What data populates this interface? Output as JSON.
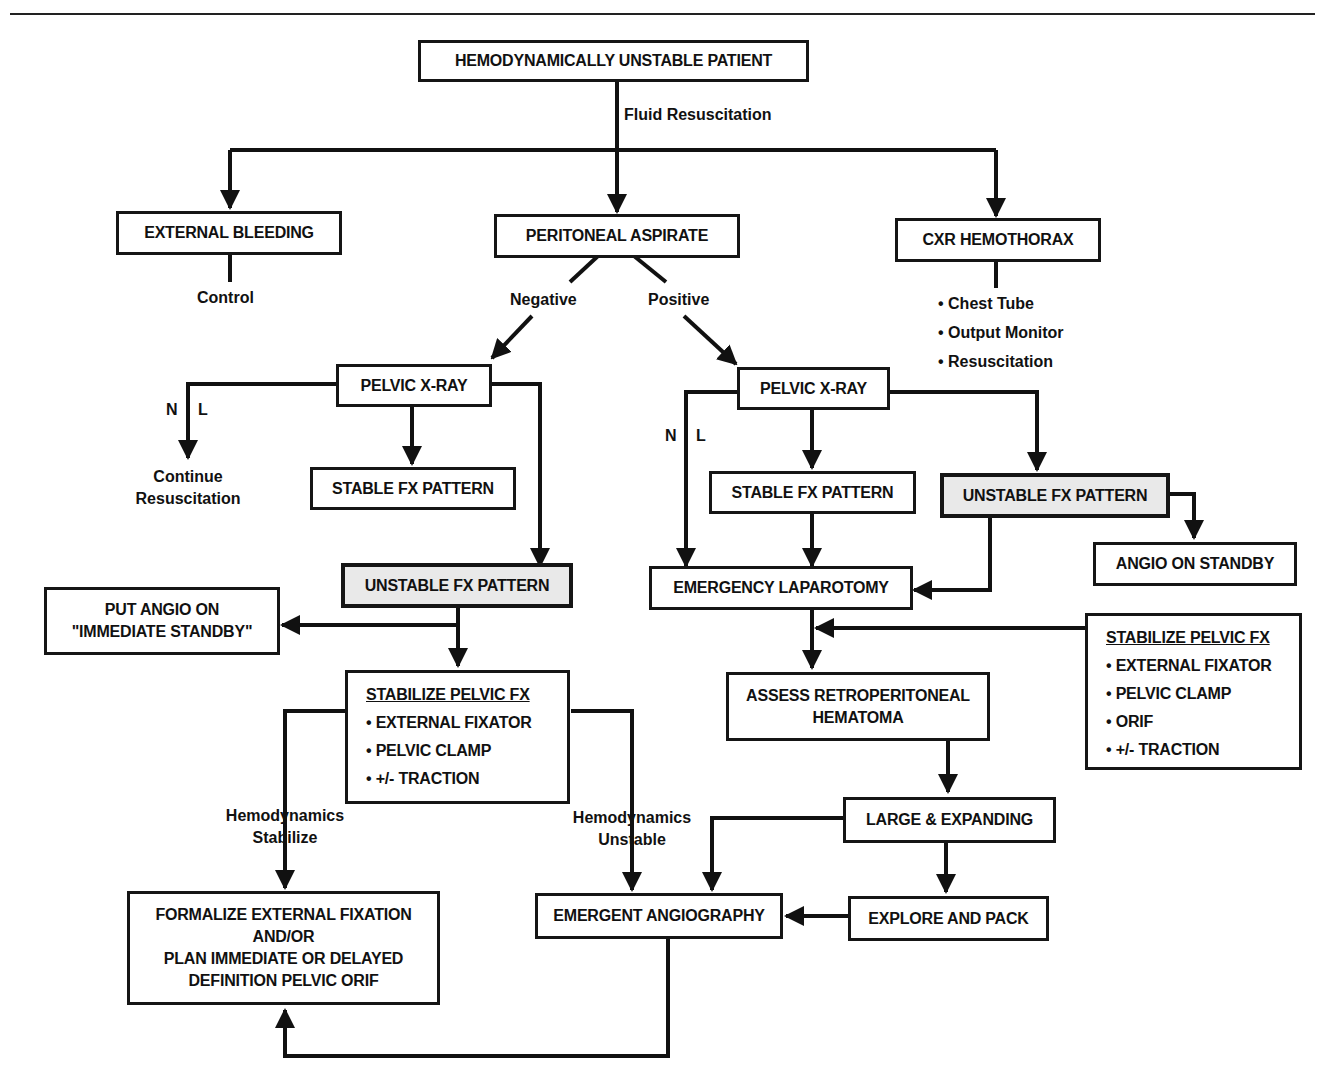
{
  "colors": {
    "ink": "#111111",
    "highlight_fill": "#e9e9e9",
    "background": "#ffffff"
  },
  "nodes": {
    "root": "HEMODYNAMICALLY UNSTABLE PATIENT",
    "external_bleeding": "EXTERNAL BLEEDING",
    "peritoneal_aspirate": "PERITONEAL ASPIRATE",
    "cxr_hemothorax": "CXR HEMOTHORAX",
    "pelvic_xray_left": "PELVIC X-RAY",
    "pelvic_xray_right": "PELVIC X-RAY",
    "stable_fx_left": "STABLE FX PATTERN",
    "stable_fx_right": "STABLE FX PATTERN",
    "unstable_fx_left": "UNSTABLE FX PATTERN",
    "unstable_fx_right": "UNSTABLE FX PATTERN",
    "angio_standby": "ANGIO ON STANDBY",
    "put_angio": [
      "PUT ANGIO ON",
      "\"IMMEDIATE STANDBY\""
    ],
    "emergency_laparotomy": "EMERGENCY LAPAROTOMY",
    "assess_retro": [
      "ASSESS RETROPERITONEAL",
      "HEMATOMA"
    ],
    "large_expanding": "LARGE & EXPANDING",
    "explore_pack": "EXPLORE AND PACK",
    "emergent_angio": "EMERGENT ANGIOGRAPHY",
    "formalize": [
      "FORMALIZE EXTERNAL FIXATION",
      "AND/OR",
      "PLAN IMMEDIATE OR DELAYED",
      "DEFINITION PELVIC ORIF"
    ],
    "stabilize_left": {
      "header": "STABILIZE PELVIC FX",
      "items": [
        "• EXTERNAL FIXATOR",
        "• PELVIC CLAMP",
        "• +/- TRACTION"
      ]
    },
    "stabilize_right": {
      "header": "STABILIZE PELVIC FX",
      "items": [
        "• EXTERNAL FIXATOR",
        "• PELVIC CLAMP",
        "• ORIF",
        "• +/- TRACTION"
      ]
    }
  },
  "labels": {
    "fluid_resuscitation": "Fluid Resuscitation",
    "control": "Control",
    "negative": "Negative",
    "positive": "Positive",
    "n_left": "N",
    "l_left": "L",
    "n_right": "N",
    "l_right": "L",
    "continue_resus": [
      "Continue",
      "Resuscitation"
    ],
    "hemo_stabilize": [
      "Hemodynamics",
      "Stabilize"
    ],
    "hemo_unstable": [
      "Hemodynamics",
      "Unstable"
    ],
    "cxr_actions": [
      "• Chest Tube",
      "• Output Monitor",
      "• Resuscitation"
    ]
  }
}
